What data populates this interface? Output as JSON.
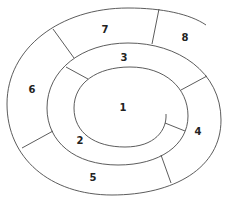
{
  "diagram": {
    "type": "spiral",
    "segments": [
      {
        "id": 1,
        "label": "1",
        "x": 123,
        "y": 108
      },
      {
        "id": 2,
        "label": "2",
        "x": 80,
        "y": 141
      },
      {
        "id": 3,
        "label": "3",
        "x": 124,
        "y": 58
      },
      {
        "id": 4,
        "label": "4",
        "x": 198,
        "y": 132
      },
      {
        "id": 5,
        "label": "5",
        "x": 93,
        "y": 178
      },
      {
        "id": 6,
        "label": "6",
        "x": 32,
        "y": 90
      },
      {
        "id": 7,
        "label": "7",
        "x": 105,
        "y": 30
      },
      {
        "id": 8,
        "label": "8",
        "x": 185,
        "y": 38
      }
    ],
    "stroke_color": "#4a4a4a",
    "label_color": "#222222",
    "background": "#ffffff"
  }
}
